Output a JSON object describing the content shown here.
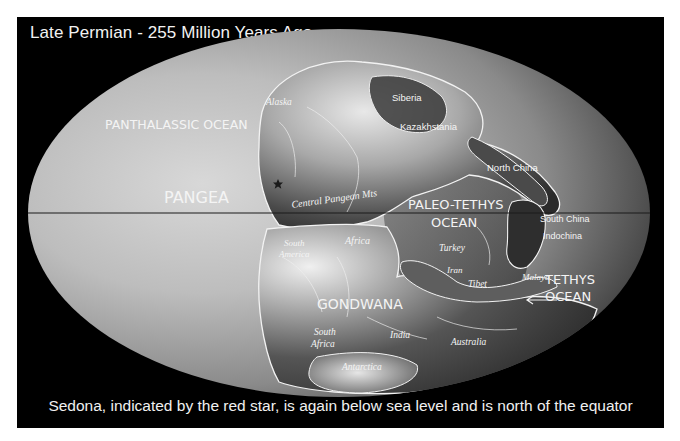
{
  "title": "Late Permian - 255 Million Years Ago",
  "caption": "Sedona, indicated by the red star, is again below sea level and is north of the equator",
  "map": {
    "projection": "elliptical (Mollweide-style)",
    "equator_line": true,
    "colors": {
      "frame": "#000000",
      "ocean_light": "#c9c9c9",
      "ocean_dark": "#5a5a5a",
      "outline": "#f2f2f2",
      "star": "#1a1a1a"
    },
    "ocean_labels": [
      {
        "id": "panthalassic",
        "text": "PANTHALASSIC OCEAN"
      },
      {
        "id": "paleo-tethys-1",
        "text": "PALEO-TETHYS"
      },
      {
        "id": "paleo-tethys-2",
        "text": "OCEAN"
      },
      {
        "id": "tethys-1",
        "text": "TETHYS"
      },
      {
        "id": "tethys-2",
        "text": "OCEAN"
      }
    ],
    "supercontinent_labels": [
      {
        "id": "pangea",
        "text": "PANGEA"
      },
      {
        "id": "gondwana",
        "text": "GONDWANA"
      }
    ],
    "region_labels": [
      {
        "id": "alaska",
        "text": "Alaska"
      },
      {
        "id": "siberia",
        "text": "Siberia"
      },
      {
        "id": "kazakhstania",
        "text": "Kazakhstania"
      },
      {
        "id": "north-china",
        "text": "North China"
      },
      {
        "id": "central-pangean-mts",
        "text": "Central Pangean Mts"
      },
      {
        "id": "south-china",
        "text": "South China"
      },
      {
        "id": "indochina",
        "text": "Indochina"
      },
      {
        "id": "south-america-1",
        "text": "South"
      },
      {
        "id": "south-america-2",
        "text": "America"
      },
      {
        "id": "africa",
        "text": "Africa"
      },
      {
        "id": "turkey",
        "text": "Turkey"
      },
      {
        "id": "iran",
        "text": "Iran"
      },
      {
        "id": "tibet",
        "text": "Tibet"
      },
      {
        "id": "malaya",
        "text": "Malaya"
      },
      {
        "id": "south-africa-1",
        "text": "South"
      },
      {
        "id": "south-africa-2",
        "text": "Africa"
      },
      {
        "id": "india",
        "text": "India"
      },
      {
        "id": "australia",
        "text": "Australia"
      },
      {
        "id": "antarctica",
        "text": "Antarctica"
      }
    ],
    "marker": {
      "name": "Sedona",
      "symbol": "star"
    }
  }
}
